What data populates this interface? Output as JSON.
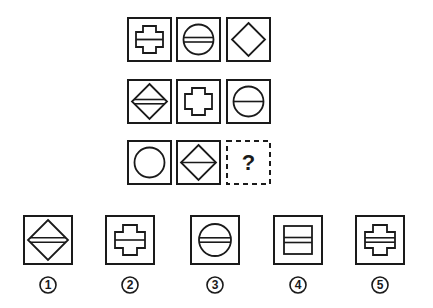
{
  "puzzle": {
    "colors": {
      "stroke": "#1a1a1a",
      "background": "#ffffff"
    },
    "grid": [
      [
        {
          "shape": "cross",
          "lines": 1
        },
        {
          "shape": "circle",
          "lines": 2
        },
        {
          "shape": "diamond",
          "lines": 0
        }
      ],
      [
        {
          "shape": "diamond",
          "lines": 2
        },
        {
          "shape": "cross",
          "lines": 0
        },
        {
          "shape": "circle",
          "lines": 1
        }
      ],
      [
        {
          "shape": "circle",
          "lines": 0
        },
        {
          "shape": "diamond",
          "lines": 1
        },
        {
          "shape": "unknown",
          "label": "?"
        }
      ]
    ],
    "options": [
      {
        "number": "1",
        "shape": "diamond",
        "lines": 2
      },
      {
        "number": "2",
        "shape": "cross",
        "lines": 1
      },
      {
        "number": "3",
        "shape": "circle",
        "lines": 2
      },
      {
        "number": "4",
        "shape": "rectangle",
        "lines": 2
      },
      {
        "number": "5",
        "shape": "cross",
        "lines": 2
      }
    ]
  }
}
